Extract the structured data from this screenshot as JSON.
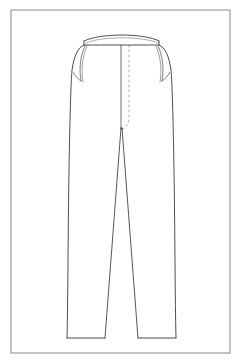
{
  "document": {
    "type": "technical-flat-sketch",
    "subject": "trousers-front-view",
    "title": "Trousers Technical Flat — Front View",
    "canvas": {
      "width": 241,
      "height": 361,
      "background_color": "#ffffff"
    },
    "frame": {
      "name": "illustration-border",
      "x": 11,
      "y": 10,
      "width": 219,
      "height": 343,
      "stroke_color": "#8a8a8a",
      "stroke_width": 1,
      "fill": "none"
    },
    "line_style": {
      "outline_color": "#3a3a3a",
      "detail_color": "#555555",
      "dash_color": "#9a9a9a",
      "outline_width": 0.9,
      "detail_width": 0.7,
      "dash_pattern": "2,3"
    }
  },
  "garment": {
    "label": "Trousers",
    "view": "front",
    "parts": [
      {
        "id": "waistband",
        "label": "Waistband",
        "top_path": "M 84 41 C 100 33 144 33 159 41",
        "bottom_path": "M 84 45 L 159 45",
        "left_edge": "M 84 41 L 84 45",
        "right_edge": "M 159 41 L 159 45",
        "inner_path": "M 86 43 C 101 36 143 36 158 43"
      },
      {
        "id": "body-outline",
        "label": "Trouser Body Outline",
        "path": "M 84 45 C 78 47 74 56 72 70 C 71 82 70 110 69 170 C 68 230 68 300 67 338 L 105 338 L 105 300 L 118 128 L 125 128 L 138 300 L 138 338 L 176 338 C 175 300 175 230 174 170 C 173 110 172 82 171 70 C 169 56 165 47 159 45 Z"
      },
      {
        "id": "left-side-seam",
        "label": "Left Side Seam",
        "path": "M 84 45 C 78 47 74 56 72 70 C 71 82 70 110 69 170 C 68 230 68 300 67 338"
      },
      {
        "id": "right-side-seam",
        "label": "Right Side Seam",
        "path": "M 159 45 C 165 47 169 56 171 70 C 172 82 173 110 174 170 C 175 230 175 300 176 338"
      },
      {
        "id": "left-hem",
        "label": "Left Leg Hem",
        "path": "M 67 338 L 105 338"
      },
      {
        "id": "right-hem",
        "label": "Right Leg Hem",
        "path": "M 138 338 L 176 338"
      },
      {
        "id": "left-inseam",
        "label": "Left Inseam",
        "path": "M 121 128 L 105 338"
      },
      {
        "id": "right-inseam",
        "label": "Right Inseam",
        "path": "M 122 128 L 138 338"
      },
      {
        "id": "center-front-seam",
        "label": "Center Front Seam",
        "path": "M 121 45 L 121 128"
      },
      {
        "id": "fly-stitch",
        "label": "Fly Topstitch",
        "path": "M 129 45 L 129 118 C 129 124 126 128 122 129",
        "style": "dashed"
      },
      {
        "id": "left-pocket-opening",
        "label": "Left Pocket Opening",
        "path": "M 85 46 C 80 56 79 70 81 81"
      },
      {
        "id": "left-pocket-bag",
        "label": "Left Pocket Bag",
        "path": "M 87 46 C 82 57 81 71 83 82"
      },
      {
        "id": "left-pocket-lower",
        "label": "Left Pocket Lower Edge",
        "path": "M 81 81 C 78 79 75 76 73 72"
      },
      {
        "id": "right-pocket-opening",
        "label": "Right Pocket Opening",
        "path": "M 158 46 C 163 56 164 70 162 81"
      },
      {
        "id": "right-pocket-bag",
        "label": "Right Pocket Bag",
        "path": "M 156 46 C 161 57 162 71 160 82"
      },
      {
        "id": "right-pocket-lower",
        "label": "Right Pocket Lower Edge",
        "path": "M 162 81 C 165 79 168 76 170 72"
      },
      {
        "id": "crotch-point",
        "label": "Crotch Point",
        "cx": 121.5,
        "cy": 128.5,
        "r": 0.9
      }
    ]
  }
}
